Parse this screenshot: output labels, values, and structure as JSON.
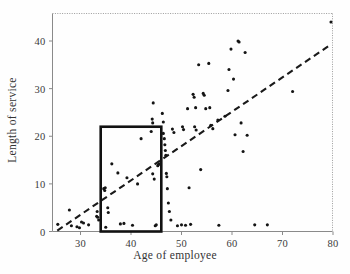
{
  "chart_data": {
    "type": "scatter",
    "title": "",
    "xlabel": "Age of employee",
    "ylabel": "Length of service",
    "xlim": [
      25,
      81
    ],
    "ylim": [
      -1,
      45
    ],
    "xticks": [
      30,
      40,
      50,
      60,
      70,
      80
    ],
    "yticks": [
      0,
      10,
      20,
      30,
      40
    ],
    "grid": false,
    "legend": null,
    "annotations": [
      {
        "name": "highlight-rectangle",
        "type": "rect",
        "x0": 34,
        "x1": 46,
        "y0": 0,
        "y1": 22,
        "stroke": "#111111",
        "stroke_width": 2.6,
        "fill": "none"
      }
    ],
    "series": [
      {
        "name": "employees",
        "type": "scatter",
        "marker": "circle",
        "color": "#141414",
        "points": [
          [
            25.5,
            1.5
          ],
          [
            27.8,
            4.5
          ],
          [
            28.2,
            1.2
          ],
          [
            29.3,
            1.0
          ],
          [
            29.8,
            0.8
          ],
          [
            30.2,
            2.0
          ],
          [
            30.6,
            1.8
          ],
          [
            31.6,
            1.4
          ],
          [
            33.2,
            3.2
          ],
          [
            33.4,
            3.0
          ],
          [
            33.3,
            4.2
          ],
          [
            33.6,
            2.4
          ],
          [
            34.6,
            9.0
          ],
          [
            34.8,
            8.6
          ],
          [
            34.9,
            9.2
          ],
          [
            35.0,
            0.9
          ],
          [
            35.4,
            5.0
          ],
          [
            35.5,
            4.0
          ],
          [
            36.2,
            14.2
          ],
          [
            37.4,
            12.3
          ],
          [
            37.9,
            1.6
          ],
          [
            38.6,
            1.7
          ],
          [
            39.2,
            11.3
          ],
          [
            40.3,
            1.3
          ],
          [
            41.3,
            10.0
          ],
          [
            42.0,
            19.5
          ],
          [
            44.0,
            21.0
          ],
          [
            44.2,
            23.6
          ],
          [
            44.3,
            22.8
          ],
          [
            44.4,
            27.0
          ],
          [
            44.3,
            12.1
          ],
          [
            44.6,
            11.0
          ],
          [
            44.8,
            1.2
          ],
          [
            45.0,
            1.4
          ],
          [
            45.3,
            13.8
          ],
          [
            45.4,
            14.0
          ],
          [
            45.6,
            14.2
          ],
          [
            46.2,
            24.8
          ],
          [
            46.4,
            23.0
          ],
          [
            46.4,
            20.6
          ],
          [
            46.6,
            19.5
          ],
          [
            46.7,
            18.2
          ],
          [
            46.8,
            17.0
          ],
          [
            46.9,
            16.0
          ],
          [
            47.0,
            12.2
          ],
          [
            47.1,
            11.5
          ],
          [
            47.2,
            9.0
          ],
          [
            47.4,
            6.0
          ],
          [
            47.6,
            4.2
          ],
          [
            47.9,
            2.4
          ],
          [
            48.2,
            21.5
          ],
          [
            48.5,
            20.8
          ],
          [
            49.2,
            1.2
          ],
          [
            50.0,
            1.4
          ],
          [
            50.8,
            1.3
          ],
          [
            50.2,
            22.0
          ],
          [
            50.4,
            21.4
          ],
          [
            51.2,
            25.8
          ],
          [
            51.5,
            9.2
          ],
          [
            51.8,
            1.5
          ],
          [
            52.3,
            28.8
          ],
          [
            52.5,
            28.2
          ],
          [
            52.8,
            26.0
          ],
          [
            52.6,
            22.0
          ],
          [
            52.9,
            21.3
          ],
          [
            53.4,
            35.0
          ],
          [
            53.8,
            13.0
          ],
          [
            54.3,
            29.0
          ],
          [
            54.5,
            28.6
          ],
          [
            54.8,
            25.8
          ],
          [
            55.4,
            35.3
          ],
          [
            55.6,
            26.0
          ],
          [
            55.8,
            22.3
          ],
          [
            56.2,
            21.6
          ],
          [
            57.2,
            23.4
          ],
          [
            57.4,
            1.3
          ],
          [
            58.6,
            24.2
          ],
          [
            59.2,
            29.6
          ],
          [
            59.4,
            34.0
          ],
          [
            59.8,
            38.3
          ],
          [
            60.3,
            32.0
          ],
          [
            60.6,
            20.3
          ],
          [
            61.2,
            40.0
          ],
          [
            61.4,
            39.8
          ],
          [
            61.8,
            22.8
          ],
          [
            62.2,
            16.8
          ],
          [
            62.6,
            37.6
          ],
          [
            63.0,
            20.2
          ],
          [
            64.5,
            1.4
          ],
          [
            67.0,
            1.4
          ],
          [
            72.0,
            29.4
          ],
          [
            79.6,
            44.0
          ]
        ]
      },
      {
        "name": "trend-line",
        "type": "line",
        "style": "dashed",
        "color": "#1a1a1a",
        "x0": 25.4,
        "y0": 0.2,
        "x1": 79.2,
        "y1": 39.0
      }
    ]
  },
  "axes": {
    "x_tick_labels": [
      "30",
      "40",
      "50",
      "60",
      "70",
      "80"
    ],
    "y_tick_labels": [
      "0",
      "10",
      "20",
      "30",
      "40"
    ]
  }
}
